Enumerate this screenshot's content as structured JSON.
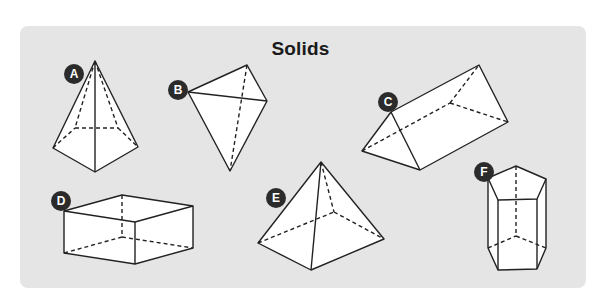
{
  "title": "Solids",
  "colors": {
    "panel": "#e5e5e5",
    "face": "#ffffff",
    "stroke": "#222222",
    "badge": "#2b2b2b",
    "badge_text": "#ffffff"
  },
  "solids": [
    {
      "label": "A",
      "shape": "pentagonal pyramid"
    },
    {
      "label": "B",
      "shape": "triangular pyramid (tetrahedron)"
    },
    {
      "label": "C",
      "shape": "triangular prism"
    },
    {
      "label": "D",
      "shape": "rectangular prism"
    },
    {
      "label": "E",
      "shape": "square pyramid"
    },
    {
      "label": "F",
      "shape": "pentagonal prism"
    }
  ]
}
